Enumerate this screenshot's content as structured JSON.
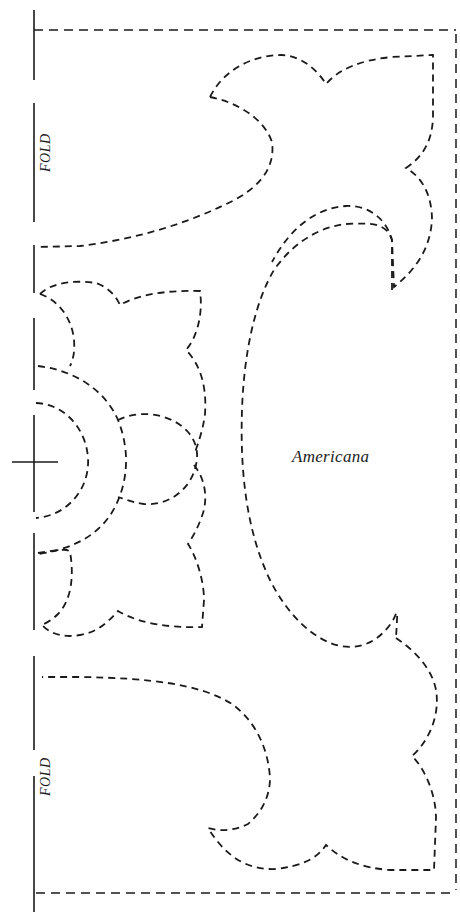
{
  "pattern": {
    "title": "Americana",
    "fold_labels": [
      "FOLD",
      "FOLD"
    ],
    "line_color": "#1a1a1a",
    "background": "#ffffff",
    "elements": {
      "fold_line": "solid vertical fold line along left edge, broken into segments",
      "center_mark": "crosshair registration mark at center of fold",
      "border": "dashed rectangular outline (top, right, bottom)",
      "motifs": [
        "top corner scroll motif",
        "top curved leaf",
        "center half-flower with concentric half-circles",
        "large central crescent swag",
        "bottom curved leaf",
        "bottom corner scroll motif"
      ]
    }
  }
}
